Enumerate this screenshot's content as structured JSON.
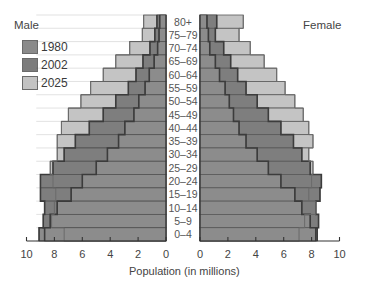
{
  "chart_data": {
    "type": "bar",
    "subtype": "population-pyramid",
    "title": "",
    "xlabel": "Population (in millions)",
    "ylabel": "",
    "xlim": [
      0,
      10
    ],
    "grid": false,
    "legend_position": "top-left",
    "categories": [
      "80+",
      "75–79",
      "70–74",
      "65–69",
      "60–64",
      "55–59",
      "50–54",
      "45–49",
      "40–44",
      "35–39",
      "30–34",
      "25–29",
      "20–24",
      "15–19",
      "10–14",
      "5–9",
      "0–4"
    ],
    "male": {
      "label": "Male",
      "series": [
        {
          "name": "1980",
          "values": [
            0.45,
            0.5,
            0.6,
            0.85,
            1.2,
            1.5,
            1.95,
            2.3,
            2.95,
            3.4,
            4.2,
            5.0,
            6.0,
            6.8,
            7.8,
            8.3,
            9.1
          ]
        },
        {
          "name": "2002",
          "values": [
            0.65,
            0.8,
            1.15,
            1.65,
            2.15,
            2.7,
            3.6,
            4.5,
            5.5,
            6.5,
            7.3,
            8.1,
            9.0,
            9.0,
            8.7,
            8.8,
            8.7
          ]
        },
        {
          "name": "2025",
          "values": [
            1.6,
            1.7,
            2.6,
            3.6,
            4.5,
            5.4,
            6.1,
            7.0,
            7.5,
            7.8,
            7.8,
            8.3,
            8.1,
            7.9,
            8.0,
            8.2,
            7.3
          ]
        }
      ]
    },
    "female": {
      "label": "Female",
      "series": [
        {
          "name": "1980",
          "values": [
            0.5,
            0.6,
            0.7,
            1.1,
            1.4,
            1.8,
            2.1,
            2.4,
            2.8,
            3.3,
            4.1,
            4.9,
            5.8,
            6.8,
            7.3,
            7.9,
            8.4
          ]
        },
        {
          "name": "2002",
          "values": [
            1.2,
            1.1,
            1.7,
            2.2,
            2.7,
            3.3,
            4.1,
            4.9,
            5.8,
            6.7,
            7.3,
            7.9,
            8.7,
            8.6,
            8.3,
            8.5,
            8.3
          ]
        },
        {
          "name": "2025",
          "values": [
            3.1,
            2.8,
            3.6,
            4.6,
            5.5,
            6.1,
            6.8,
            7.4,
            7.8,
            8.1,
            7.8,
            8.1,
            8.0,
            7.8,
            8.3,
            7.5,
            7.1
          ]
        }
      ]
    },
    "x_ticks_male": [
      "10",
      "8",
      "6",
      "4",
      "2",
      "0"
    ],
    "x_ticks_female": [
      "0",
      "2",
      "4",
      "6",
      "8",
      "10"
    ]
  },
  "legend": [
    {
      "label": "1980",
      "color": "#8a8a8a"
    },
    {
      "label": "2002",
      "color": "#7c7c7c"
    },
    {
      "label": "2025",
      "color": "#c2c2c2"
    }
  ],
  "colors": {
    "1980": "#8c8c8c",
    "2002": "#7e7e7e",
    "2025": "#c4c4c4",
    "outline": "#4a4a4a"
  },
  "labels": {
    "male": "Male",
    "female": "Female",
    "xaxis": "Population (in millions)"
  }
}
